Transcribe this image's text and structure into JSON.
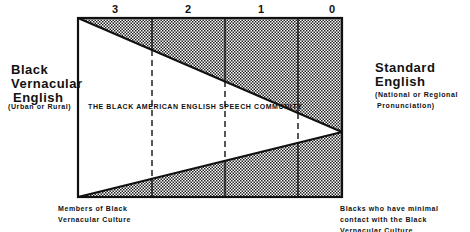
{
  "diagram": {
    "column_labels": [
      "3",
      "2",
      "1",
      "0"
    ],
    "left_title": [
      "Black",
      "Vernacular",
      "English"
    ],
    "left_subtitle": "(Urban or Rural)",
    "right_title": [
      "Standard",
      "English"
    ],
    "right_subtitle": [
      "(National or Regional",
      "Pronunciation)"
    ],
    "center_label": "THE BLACK AMERICAN ENGLISH SPEECH COMMUNITY",
    "bottom_left_caption": [
      "Members of Black",
      "Vernacular Culture"
    ],
    "bottom_right_caption": [
      "Blacks who have minimal",
      "contact with the Black",
      "Vernacular Culture"
    ],
    "colors": {
      "line": "#111111",
      "fill_pattern": "#222222",
      "background": "#ffffff"
    }
  }
}
